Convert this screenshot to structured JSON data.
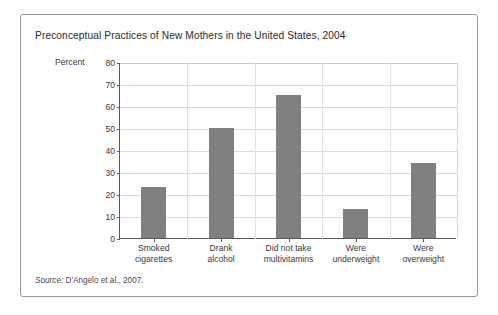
{
  "figure": {
    "title": "Preconceptual Practices of New Mothers in the United States, 2004",
    "source_label": "Source:",
    "source_text": " D'Angelo et al., 2007.",
    "frame_border_color": "#9a9a9a",
    "background_color": "#ffffff"
  },
  "chart_data": {
    "type": "bar",
    "title": "Preconceptual Practices of New Mothers in the United States, 2004",
    "categories": [
      "Smoked cigarettes",
      "Drank alcohol",
      "Did not take multivitamins",
      "Were underweight",
      "Were overweight"
    ],
    "category_lines": [
      [
        "Smoked",
        "cigarettes"
      ],
      [
        "Drank",
        "alcohol"
      ],
      [
        "Did not take",
        "multivitamins"
      ],
      [
        "Were",
        "underweight"
      ],
      [
        "Were",
        "overweight"
      ]
    ],
    "values": [
      23,
      50,
      65,
      13,
      34
    ],
    "xlabel": "",
    "ylabel": "Percent",
    "ylim": [
      0,
      80
    ],
    "yticks": [
      0,
      10,
      20,
      30,
      40,
      50,
      60,
      70,
      80
    ],
    "ytick_labels": [
      "0",
      "10",
      "20",
      "30",
      "40",
      "50",
      "60",
      "70",
      "80"
    ],
    "grid": true,
    "grid_orientation": "horizontal-and-category-separators",
    "legend": false,
    "bar_color": "#808080",
    "gridline_color": "#dcdcdc",
    "axis_color": "#5a5a5a"
  }
}
